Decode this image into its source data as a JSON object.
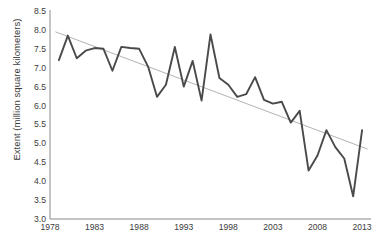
{
  "chart_data": {
    "type": "line",
    "title": "",
    "xlabel": "",
    "ylabel": "Extent (million square kilometers)",
    "xlim": [
      1978,
      2014
    ],
    "ylim": [
      3.0,
      8.5
    ],
    "grid": false,
    "legend": null,
    "x_tick_labels": [
      "1978",
      "1983",
      "1988",
      "1993",
      "1998",
      "2003",
      "2008",
      "2013"
    ],
    "x_ticks": [
      1978,
      1983,
      1988,
      1993,
      1998,
      2003,
      2008,
      2013
    ],
    "y_tick_labels": [
      "3.0",
      "3.5",
      "4.0",
      "4.5",
      "5.0",
      "5.5",
      "6.0",
      "6.5",
      "7.0",
      "7.5",
      "8.0",
      "8.5"
    ],
    "y_ticks": [
      3.0,
      3.5,
      4.0,
      4.5,
      5.0,
      5.5,
      6.0,
      6.5,
      7.0,
      7.5,
      8.0,
      8.5
    ],
    "series": [
      {
        "name": "Sea ice extent",
        "color": "#4a4a4a",
        "x": [
          1979,
          1980,
          1981,
          1982,
          1983,
          1984,
          1985,
          1986,
          1987,
          1988,
          1989,
          1990,
          1991,
          1992,
          1993,
          1994,
          1995,
          1996,
          1997,
          1998,
          1999,
          2000,
          2001,
          2002,
          2003,
          2004,
          2005,
          2006,
          2007,
          2008,
          2009,
          2010,
          2011,
          2012,
          2013
        ],
        "values": [
          7.2,
          7.85,
          7.25,
          7.45,
          7.52,
          7.5,
          6.92,
          7.55,
          7.52,
          7.5,
          7.03,
          6.23,
          6.55,
          7.55,
          6.5,
          7.18,
          6.13,
          7.88,
          6.73,
          6.55,
          6.23,
          6.3,
          6.75,
          6.15,
          6.05,
          6.1,
          5.55,
          5.86,
          4.28,
          4.68,
          5.35,
          4.9,
          4.6,
          3.6,
          5.35
        ]
      },
      {
        "name": "Linear trend",
        "color": "#b3b3b3",
        "x": [
          1978.6,
          2013.6
        ],
        "values": [
          7.95,
          4.85
        ]
      }
    ]
  }
}
